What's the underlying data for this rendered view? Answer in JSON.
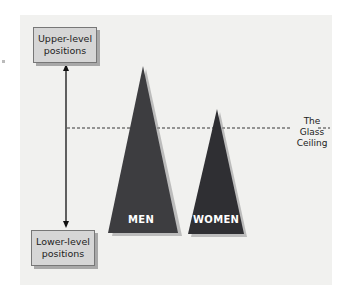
{
  "diagram": {
    "boxes": {
      "upper": {
        "line1": "Upper-level",
        "line2": "positions"
      },
      "lower": {
        "line1": "Lower-level",
        "line2": "positions"
      }
    },
    "triangles": [
      {
        "label": "MEN",
        "color": "#3d3d40"
      },
      {
        "label": "WOMEN",
        "color": "#2f2f33"
      }
    ],
    "ceiling": {
      "line1": "The",
      "line2": "Glass",
      "line3": "Ceiling"
    },
    "colors": {
      "panel": "#f1f1ef",
      "box": "#d6d6d6",
      "triangle": "#3a3a3e"
    }
  }
}
